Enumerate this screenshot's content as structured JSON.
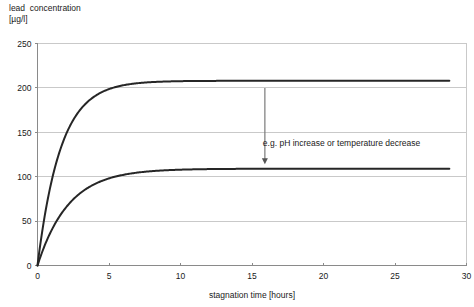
{
  "chart_data": {
    "type": "line",
    "title": "",
    "ylabel": "lead  concentration\n[µg/l]",
    "xlabel": "stagnation time [hours]",
    "xlim": [
      0,
      30
    ],
    "ylim": [
      0,
      250
    ],
    "xticks": [
      0,
      5,
      10,
      15,
      20,
      25,
      30
    ],
    "yticks": [
      0,
      50,
      100,
      150,
      200,
      250
    ],
    "grid": true,
    "grid_axis": "y",
    "legend": "none",
    "curve_color": "#262626",
    "grid_color": "#c9c9c9",
    "axis_color": "#8a8a8a",
    "x_end_of_data": 28.8,
    "series": [
      {
        "name": "upper curve",
        "plateau": 208,
        "rate": 0.62,
        "model": "y = plateau * (1 - exp(-rate * t))",
        "x": [
          0,
          0.5,
          1,
          1.5,
          2,
          2.5,
          3,
          3.5,
          4,
          4.5,
          5,
          6,
          7,
          8,
          9,
          10,
          12,
          14,
          16,
          18,
          20,
          22,
          24,
          26,
          28,
          28.8
        ],
        "values": [
          0,
          55,
          96,
          126,
          148,
          164,
          176,
          184,
          190,
          195,
          199,
          203,
          206,
          207,
          207.5,
          208,
          208,
          208,
          208,
          208,
          208,
          208,
          208,
          208,
          208,
          208
        ]
      },
      {
        "name": "lower curve",
        "plateau": 109,
        "rate": 0.46,
        "model": "y = plateau * (1 - exp(-rate * t))",
        "x": [
          0,
          0.5,
          1,
          1.5,
          2,
          2.5,
          3,
          3.5,
          4,
          4.5,
          5,
          6,
          7,
          8,
          9,
          10,
          12,
          14,
          16,
          18,
          20,
          22,
          24,
          26,
          28,
          28.8
        ],
        "values": [
          0,
          22,
          40,
          54,
          66,
          75,
          82,
          87,
          92,
          95,
          98,
          102,
          105,
          107,
          108,
          108.5,
          109,
          109,
          109,
          109,
          109,
          109,
          109,
          109,
          109,
          109
        ]
      }
    ],
    "annotations": [
      {
        "name": "effect-annotation",
        "text": "e.g. pH increase or temperature decrease",
        "text_x": 16.1,
        "text_y": 135,
        "arrow_x": 15.9,
        "arrow_y_start": 200,
        "arrow_y_end": 114
      }
    ]
  }
}
